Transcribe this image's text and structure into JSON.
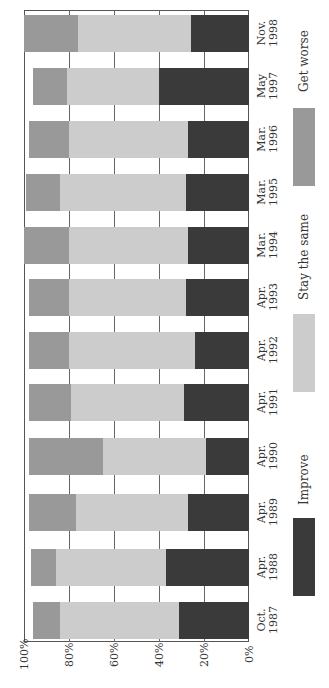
{
  "chart_data": {
    "type": "bar",
    "stacked": true,
    "orientation": "vertical (image rotated 90° counter-clockwise)",
    "title": "",
    "xlabel": "",
    "ylabel": "",
    "ylim": [
      0,
      100
    ],
    "yticks": [
      "0%",
      "20%",
      "40%",
      "60%",
      "80%",
      "100%"
    ],
    "grid": true,
    "categories": [
      [
        "Oct.",
        "1987"
      ],
      [
        "Apr.",
        "1988"
      ],
      [
        "Apr.",
        "1989"
      ],
      [
        "Apr.",
        "1990"
      ],
      [
        "Apr.",
        "1991"
      ],
      [
        "Apr.",
        "1992"
      ],
      [
        "Apr.",
        "1993"
      ],
      [
        "Mar.",
        "1994"
      ],
      [
        "Mar.",
        "1995"
      ],
      [
        "Mar.",
        "1996"
      ],
      [
        "May",
        "1997"
      ],
      [
        "Nov.",
        "1998"
      ]
    ],
    "series": [
      {
        "name": "Improve",
        "color": "#3a3a3a",
        "values": [
          31,
          37,
          27,
          19,
          29,
          24,
          28,
          27,
          28,
          27,
          40,
          26
        ]
      },
      {
        "name": "Stay the same",
        "color": "#cccccc",
        "values": [
          53,
          49,
          50,
          46,
          50,
          56,
          52,
          53,
          56,
          53,
          41,
          50
        ]
      },
      {
        "name": "Get worse",
        "color": "#999999",
        "values": [
          12,
          11,
          21,
          33,
          19,
          18,
          18,
          20,
          15,
          18,
          15,
          24
        ]
      }
    ],
    "legend": {
      "position": "bottom",
      "entries": [
        "Improve",
        "Stay the same",
        "Get worse"
      ]
    }
  }
}
